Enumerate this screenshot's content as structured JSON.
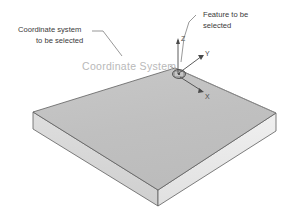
{
  "diagram": {
    "background_color": "#ffffff"
  },
  "annotations": {
    "left_label": {
      "line1": "Coordinate system",
      "line2": "to be selected",
      "color": "#3a3a3a"
    },
    "right_label": {
      "line1": "Feature to be",
      "line2": "selected",
      "color": "#3a3a3a"
    },
    "center_label": {
      "text": "Coordinate System",
      "color": "#b9b9b9"
    }
  },
  "axes": {
    "x_label": "X",
    "y_label": "Y",
    "z_label": "Z",
    "color": "#4a4a4a",
    "origin_marker": "circle-origin-marker"
  },
  "solid": {
    "name": "rectangular-plate",
    "top_face_color": "#c2c2c2",
    "left_face_color": "#d8d8d8",
    "right_face_color": "#e9e9e9",
    "edge_color": "#5e5e5e"
  }
}
